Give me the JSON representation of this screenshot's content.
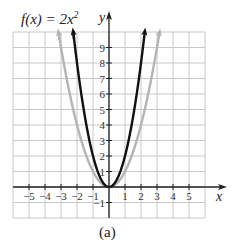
{
  "chart_data": {
    "type": "line",
    "title": "f(x) = 2x",
    "title_exponent": "2",
    "caption": "(a)",
    "xlabel": "x",
    "ylabel": "y",
    "xlim": [
      -6,
      6
    ],
    "ylim": [
      -2,
      10
    ],
    "grid": true,
    "x_ticks": [
      -5,
      -4,
      -3,
      -2,
      -1,
      1,
      2,
      3,
      4,
      5
    ],
    "x_tick_labels": [
      "−5",
      "−4",
      "−3",
      "−2",
      "−1",
      "1",
      "2",
      "3",
      "4",
      "5"
    ],
    "y_ticks": [
      -1,
      1,
      2,
      3,
      4,
      5,
      6,
      7,
      8,
      9
    ],
    "y_tick_labels": [
      "−1",
      "1",
      "2",
      "3",
      "4",
      "5",
      "6",
      "7",
      "8",
      "9"
    ],
    "series": [
      {
        "name": "f(x) = 2x^2",
        "expression": "2x^2",
        "coefficient": 2,
        "color": "#111111",
        "x_range": [
          -2.24,
          2.24
        ]
      },
      {
        "name": "y = x^2",
        "expression": "x^2",
        "coefficient": 1,
        "color": "#b4b4b4",
        "x_range": [
          -3.16,
          3.16
        ]
      }
    ]
  }
}
